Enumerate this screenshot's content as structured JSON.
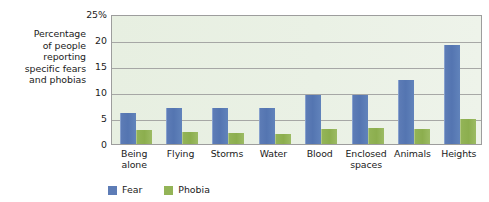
{
  "chart_data": {
    "type": "bar",
    "title": "",
    "xlabel": "",
    "ylabel": "Percentage of people reporting specific fears and phobias",
    "ylabel_lines": [
      "Percentage",
      "of people",
      "reporting",
      "specific fears",
      "and phobias"
    ],
    "categories": [
      "Being alone",
      "Flying",
      "Storms",
      "Water",
      "Blood",
      "Enclosed spaces",
      "Animals",
      "Heights"
    ],
    "category_lines": [
      [
        "Being",
        "alone"
      ],
      [
        "Flying"
      ],
      [
        "Storms"
      ],
      [
        "Water"
      ],
      [
        "Blood"
      ],
      [
        "Enclosed",
        "spaces"
      ],
      [
        "Animals"
      ],
      [
        "Heights"
      ]
    ],
    "series": [
      {
        "name": "Fear",
        "color": "#5d7cb6",
        "values": [
          6.0,
          7.0,
          7.0,
          7.0,
          9.4,
          9.4,
          12.4,
          19.0
        ]
      },
      {
        "name": "Phobia",
        "color": "#93b457",
        "values": [
          2.7,
          2.3,
          2.1,
          1.9,
          2.9,
          3.0,
          2.9,
          4.8
        ]
      }
    ],
    "ylim": [
      0,
      25
    ],
    "yticks": [
      0,
      5,
      10,
      15,
      20,
      25
    ],
    "ytick_labels": [
      "0",
      "5",
      "10",
      "15",
      "20",
      "25%"
    ],
    "grid": true,
    "legend_position": "bottom-left",
    "plot_background": "#e8f0e2",
    "plot_border_color": "#9d9d9d",
    "gridline_color": "#9a9a9a"
  }
}
